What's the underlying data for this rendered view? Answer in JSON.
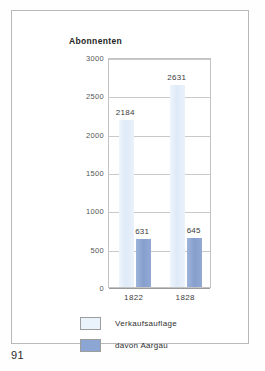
{
  "page": {
    "number": "91"
  },
  "figure": {
    "title": "Abonnenten"
  },
  "chart_data": {
    "type": "bar",
    "title": "Abonnenten",
    "xlabel": "",
    "ylabel": "",
    "ylim": [
      0,
      3000
    ],
    "ytick_labels": [
      "3000",
      "2500",
      "2000",
      "1500",
      "1000",
      "500",
      "0"
    ],
    "ytick_values": [
      3000,
      2500,
      2000,
      1500,
      1000,
      500,
      0
    ],
    "grid": true,
    "legend_position": "bottom-left",
    "categories": [
      "1822",
      "1828"
    ],
    "series": [
      {
        "name": "Verkaufsauflage",
        "color": "#e3eefa",
        "values": [
          2184,
          2631
        ],
        "labels": [
          "2184",
          "2631"
        ]
      },
      {
        "name": "davon Aargau",
        "color": "#8ba6d2",
        "values": [
          631,
          645
        ],
        "labels": [
          "631",
          "645"
        ]
      }
    ]
  }
}
